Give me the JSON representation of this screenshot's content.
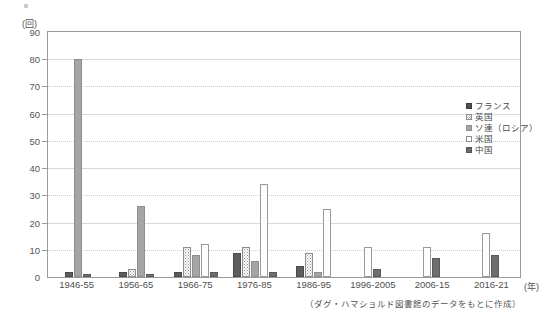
{
  "figure": {
    "y_unit_label": "(回)",
    "x_unit_label": "(年)",
    "source_note": "（ダグ・ハマショルド図書館のデータをもとに作成）"
  },
  "legend": {
    "position": "inside-top-right",
    "items": [
      {
        "key": "france",
        "label": "フランス",
        "swatch": "dark-filled-square",
        "color": "#4f4f4f"
      },
      {
        "key": "uk",
        "label": "英国",
        "swatch": "fine-dotted-square",
        "color": "#8a8a8a"
      },
      {
        "key": "ussr",
        "label": "ソ連（ロシア）",
        "swatch": "gray-filled-square",
        "color": "#a5a5a5"
      },
      {
        "key": "usa",
        "label": "米国",
        "swatch": "white-square",
        "color": "#ffffff"
      },
      {
        "key": "china",
        "label": "中国",
        "swatch": "dark-gray-square",
        "color": "#6b6b6b"
      }
    ]
  },
  "chart_data": {
    "type": "bar",
    "title": "",
    "xlabel": "(年)",
    "ylabel": "(回)",
    "ylim": [
      0,
      90
    ],
    "yticks": [
      0,
      10,
      20,
      30,
      40,
      50,
      60,
      70,
      80,
      90
    ],
    "grid": true,
    "categories": [
      "1946-55",
      "1956-65",
      "1966-75",
      "1976-85",
      "1986-95",
      "1996-2005",
      "2006-15",
      "2016-21"
    ],
    "series": [
      {
        "name": "フランス",
        "values": [
          2,
          2,
          2,
          9,
          4,
          0,
          0,
          0
        ]
      },
      {
        "name": "英国",
        "values": [
          0,
          3,
          11,
          11,
          9,
          0,
          0,
          0
        ]
      },
      {
        "name": "ソ連（ロシア）",
        "values": [
          80,
          26,
          8,
          6,
          2,
          0,
          0,
          0
        ]
      },
      {
        "name": "米国",
        "values": [
          0,
          0,
          12,
          34,
          25,
          11,
          11,
          16
        ]
      },
      {
        "name": "中国",
        "values": [
          1,
          1,
          2,
          2,
          0,
          3,
          7,
          8
        ]
      }
    ]
  }
}
